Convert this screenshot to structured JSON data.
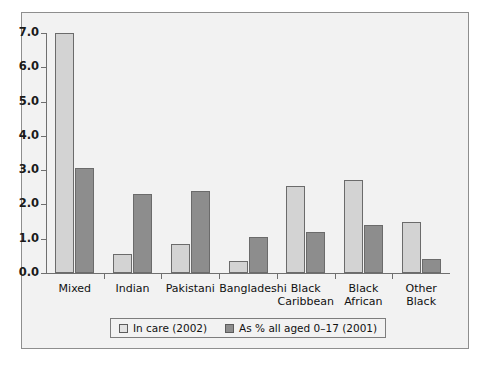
{
  "chart_data": {
    "type": "bar",
    "title": "",
    "xlabel": "",
    "ylabel": "",
    "ylim": [
      0.0,
      7.0
    ],
    "ytick_labels": [
      "0.0",
      "1.0",
      "2.0",
      "3.0",
      "4.0",
      "5.0",
      "6.0",
      "7.0"
    ],
    "ytick_values": [
      0.0,
      1.0,
      2.0,
      3.0,
      4.0,
      5.0,
      6.0,
      7.0
    ],
    "grid": false,
    "legend_position": "bottom",
    "categories": [
      "Mixed",
      "Indian",
      "Pakistani",
      "Bangladeshi",
      "Black\nCaribbean",
      "Black\nAfrican",
      "Other\nBlack"
    ],
    "series": [
      {
        "name": "In care (2002)",
        "color": "#d3d3d3",
        "values": [
          7.0,
          0.55,
          0.85,
          0.35,
          2.55,
          2.7,
          1.5
        ]
      },
      {
        "name": "As % all aged 0–17 (2001)",
        "color": "#8d8d8d",
        "values": [
          3.05,
          2.3,
          2.4,
          1.05,
          1.2,
          1.4,
          0.4
        ]
      }
    ]
  },
  "legend": {
    "items": [
      {
        "label": "In care (2002)",
        "swatch": "light"
      },
      {
        "label": "As % all aged 0–17 (2001)",
        "swatch": "dark"
      }
    ]
  }
}
